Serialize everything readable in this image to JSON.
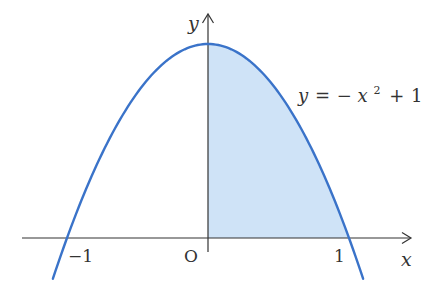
{
  "figure": {
    "equation_label": "y = −x² + 1",
    "equation_parts": {
      "lhs": "y",
      "eq": "=",
      "minus": "−",
      "var": "x",
      "exp": "2",
      "plus": "+",
      "const": "1"
    },
    "axis_labels": {
      "x": "x",
      "y": "y"
    },
    "tick_labels": {
      "neg_one": "−1",
      "origin": "O",
      "one": "1"
    },
    "colors": {
      "curve": "#3a73c9",
      "fill": "#cfe3f7",
      "axis": "#333333",
      "text": "#333333"
    }
  },
  "chart_data": {
    "type": "line",
    "title": "",
    "function": "y = -x^2 + 1",
    "xlabel": "x",
    "ylabel": "y",
    "xlim": [
      -1.32,
      1.45
    ],
    "ylim": [
      -0.25,
      1.15
    ],
    "x_ticks": [
      -1,
      0,
      1
    ],
    "x_tick_labels": [
      "−1",
      "O",
      "1"
    ],
    "series": [
      {
        "name": "y = −x² + 1",
        "x": [
          -1.1,
          -1.0,
          -0.75,
          -0.5,
          -0.25,
          0,
          0.25,
          0.5,
          0.75,
          1.0,
          1.1
        ],
        "y": [
          -0.21,
          0,
          0.4375,
          0.75,
          0.9375,
          1,
          0.9375,
          0.75,
          0.4375,
          0,
          -0.21
        ]
      }
    ],
    "shaded_region": {
      "x_from": 0,
      "x_to": 1,
      "between": "curve and x-axis",
      "color": "#cfe3f7"
    },
    "grid": false,
    "legend": "none"
  }
}
